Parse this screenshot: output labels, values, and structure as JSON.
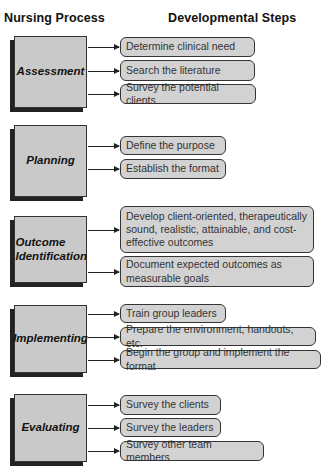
{
  "headers": {
    "left": "Nursing Process",
    "right": "Developmental Steps"
  },
  "stages": [
    {
      "name": "Assessment",
      "box": {
        "top": 36,
        "height": 72
      },
      "steps": [
        {
          "label": "Determine clinical need",
          "top": 37,
          "width": 135,
          "height": 20
        },
        {
          "label": "Search the literature",
          "top": 60,
          "width": 135,
          "height": 21
        },
        {
          "label": "Survey the potential clients",
          "top": 84,
          "width": 136,
          "height": 20
        }
      ]
    },
    {
      "name": "Planning",
      "box": {
        "top": 125,
        "height": 72
      },
      "steps": [
        {
          "label": "Define the purpose",
          "top": 136,
          "width": 106,
          "height": 19
        },
        {
          "label": "Establish the format",
          "top": 159,
          "width": 106,
          "height": 20
        }
      ]
    },
    {
      "name": "Outcome Identification",
      "box": {
        "top": 216,
        "height": 67
      },
      "steps": [
        {
          "label": "Develop client-oriented, therapeutically sound, realistic, attainable, and cost-effective outcomes",
          "top": 206,
          "width": 194,
          "height": 47
        },
        {
          "label": "Document expected outcomes as measurable goals",
          "top": 256,
          "width": 194,
          "height": 31
        }
      ]
    },
    {
      "name": "Implementing",
      "box": {
        "top": 305,
        "height": 68
      },
      "steps": [
        {
          "label": "Train group leaders",
          "top": 304,
          "width": 106,
          "height": 19
        },
        {
          "label": "Prepare the environment, handouts, etc.",
          "top": 327,
          "width": 196,
          "height": 19
        },
        {
          "label": "Begin the group and implement the format",
          "top": 350,
          "width": 201,
          "height": 19
        }
      ]
    },
    {
      "name": "Evaluating",
      "box": {
        "top": 394,
        "height": 68
      },
      "steps": [
        {
          "label": "Survey the clients",
          "top": 395,
          "width": 101,
          "height": 20
        },
        {
          "label": "Survey the leaders",
          "top": 418,
          "width": 101,
          "height": 19
        },
        {
          "label": "Survey other team members",
          "top": 441,
          "width": 144,
          "height": 20
        }
      ]
    }
  ]
}
